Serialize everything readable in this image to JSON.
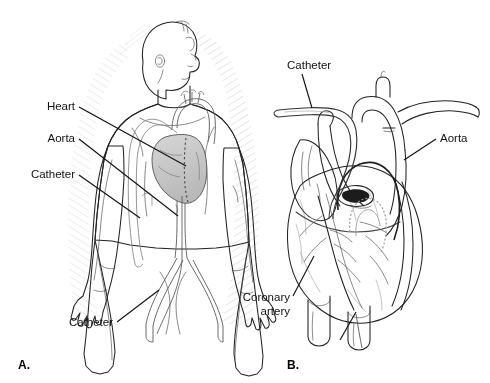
{
  "figure": {
    "background_color": "#ffffff",
    "ink_color": "#3a3a3a",
    "leader_color": "#111111",
    "width": 490,
    "height": 383
  },
  "panels": [
    {
      "id": "A",
      "panel_label": "A.",
      "caption": "Whole-body view showing catheter path from groin to heart",
      "labels": [
        {
          "name": "heart",
          "text": "Heart",
          "x": 75,
          "y": 110,
          "anchor": "end",
          "lines": 1
        },
        {
          "name": "aorta",
          "text": "Aorta",
          "x": 75,
          "y": 142,
          "anchor": "end",
          "lines": 1
        },
        {
          "name": "catheter-upper",
          "text": "Catheter",
          "x": 75,
          "y": 178,
          "anchor": "end",
          "lines": 1
        },
        {
          "name": "catheter-lower",
          "text": "Catheter",
          "x": 113,
          "y": 326,
          "anchor": "end",
          "lines": 1
        }
      ]
    },
    {
      "id": "B",
      "panel_label": "B.",
      "caption": "Close-up of heart with catheter entering the coronary artery",
      "labels": [
        {
          "name": "catheter",
          "text": "Catheter",
          "x": 287,
          "y": 69,
          "anchor": "start",
          "lines": 1
        },
        {
          "name": "aorta",
          "text": "Aorta",
          "x": 440,
          "y": 142,
          "anchor": "start",
          "lines": 1
        },
        {
          "name": "coronary-artery-line1",
          "text": "Coronary",
          "x": 290,
          "y": 301,
          "anchor": "end",
          "lines": 2
        },
        {
          "name": "coronary-artery-line2",
          "text": "artery",
          "x": 290,
          "y": 315,
          "anchor": "end",
          "lines": 2
        }
      ]
    }
  ]
}
